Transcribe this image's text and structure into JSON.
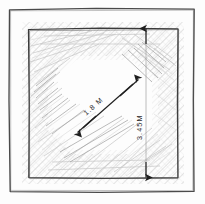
{
  "drawing": {
    "type": "architectural-sketch",
    "title": "Hand-drawn square room plan with dimension annotations",
    "style": "pencil-sketch",
    "background_color": "#fdfdfd",
    "outer_frame": {
      "name": "outer-sketch-border",
      "color": "#4a4a4a",
      "x": 9,
      "y": 8,
      "width": 186,
      "height": 184
    },
    "inner_square": {
      "name": "inner-room-outline",
      "color": "#3a3a3a",
      "x": 28,
      "y": 28,
      "width": 150,
      "height": 150
    },
    "hatch_ring": {
      "name": "hatched-wall-band",
      "color": "#b9b9b9",
      "shape": "octagonal-ring",
      "description": "diagonal pencil hatching forming an octagonal band between the inner square and the central open area"
    },
    "dimensions": [
      {
        "id": "diagonal-dimension",
        "label": "1.8 M",
        "value": 1.8,
        "unit": "M",
        "orientation": "diagonal",
        "arrow_style": "double-headed",
        "from": {
          "x": 78,
          "y": 133
        },
        "to": {
          "x": 138,
          "y": 79
        },
        "label_rotation": -42,
        "color": "#2b2b2b"
      },
      {
        "id": "vertical-dimension",
        "label": "3.45M",
        "value": 3.45,
        "unit": "M",
        "orientation": "vertical",
        "arrow_style": "double-headed",
        "from": {
          "x": 146,
          "y": 28
        },
        "to": {
          "x": 146,
          "y": 178
        },
        "label_rotation": -90,
        "color": "#2b2b2b"
      }
    ]
  }
}
